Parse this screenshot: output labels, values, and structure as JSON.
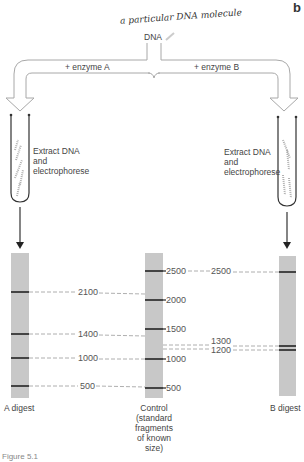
{
  "figure": {
    "corner_letter": "b",
    "handwritten_note": "a particular DNA molecule",
    "source_label": "DNA",
    "branch_left_label": "+ enzyme A",
    "branch_right_label": "+ enzyme B",
    "step_left": [
      "Extract DNA",
      "and",
      "electrophorese"
    ],
    "step_right": [
      "Extract DNA",
      "and",
      "electrophorese"
    ],
    "figure_caption": "Figure 5.1"
  },
  "lanes": {
    "a_digest": {
      "label": "A digest",
      "bands": [
        2100,
        1400,
        1000,
        500
      ]
    },
    "control": {
      "label_lines": [
        "Control",
        "(standard",
        "fragments",
        "of known",
        "size)"
      ],
      "bands": [
        2500,
        2000,
        1500,
        1000,
        500
      ],
      "band_labels": [
        "2500",
        "2000",
        "1500",
        "1000",
        "500"
      ]
    },
    "b_digest": {
      "label": "B digest",
      "bands": [
        2500,
        1300,
        1200
      ]
    }
  },
  "connector_labels": {
    "a_2100": "2100",
    "a_1400": "1400",
    "a_1000": "1000",
    "a_500": "500",
    "b_2500": "2500",
    "b_1300": "1300",
    "b_1200": "1200"
  },
  "colors": {
    "gel": "#c8c8c8",
    "band": "#222222",
    "arrow_outline": "#aaaaaa",
    "dash": "#999999"
  }
}
